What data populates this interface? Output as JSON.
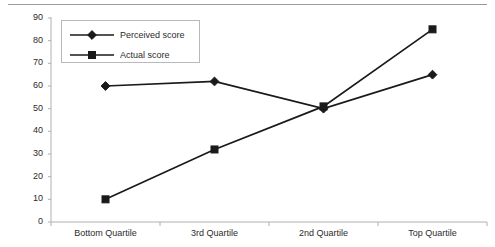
{
  "chart_data": {
    "type": "line",
    "title": "",
    "subtitle": "",
    "xlabel": "",
    "ylabel": "",
    "categories": [
      "Bottom Quartile",
      "3rd Quartile",
      "2nd Quartile",
      "Top Quartile"
    ],
    "series": [
      {
        "name": "Perceived score",
        "marker": "diamond",
        "color": "#1a1a1a",
        "values": [
          60,
          62,
          50,
          65
        ]
      },
      {
        "name": "Actual score",
        "marker": "square",
        "color": "#1a1a1a",
        "values": [
          10,
          32,
          51,
          85
        ]
      }
    ],
    "ylim": [
      0,
      90
    ],
    "ytick_labels": [
      "0",
      "10",
      "20",
      "30",
      "40",
      "50",
      "60",
      "70",
      "80",
      "90"
    ],
    "ytick_values": [
      0,
      10,
      20,
      30,
      40,
      50,
      60,
      70,
      80,
      90
    ],
    "grid": false,
    "legend_position": "upper-left",
    "legend_border_color": "#b9b9b9",
    "axis_color": "#b0b0b0",
    "line_color": "#1a1a1a",
    "text_color": "#2b2b2b",
    "top_rule_color": "#9a9a9a"
  },
  "legend": {
    "entries": [
      {
        "label": "Perceived score",
        "marker": "diamond-marker-icon"
      },
      {
        "label": "Actual score",
        "marker": "square-marker-icon"
      }
    ]
  }
}
